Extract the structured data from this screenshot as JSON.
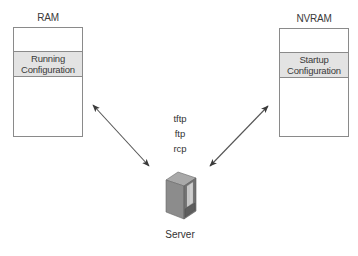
{
  "diagram": {
    "ram": {
      "label": "RAM",
      "config_line1": "Running",
      "config_line2": "Configuration"
    },
    "nvram": {
      "label": "NVRAM",
      "config_line1": "Startup",
      "config_line2": "Configuration"
    },
    "protocols": [
      "tftp",
      "ftp",
      "rcp"
    ],
    "server": {
      "label": "Server",
      "icon": "server-tower-icon"
    },
    "connections": [
      {
        "from": "RAM",
        "to": "Server",
        "type": "bidirectional-arrow"
      },
      {
        "from": "NVRAM",
        "to": "Server",
        "type": "bidirectional-arrow"
      }
    ],
    "colors": {
      "box_border": "#8a8a8a",
      "config_fill": "#e3e3e3",
      "arrow": "#555555",
      "server_body": "#8c8c8c",
      "server_top": "#a8a8a8",
      "server_side": "#6e6e6e"
    }
  }
}
